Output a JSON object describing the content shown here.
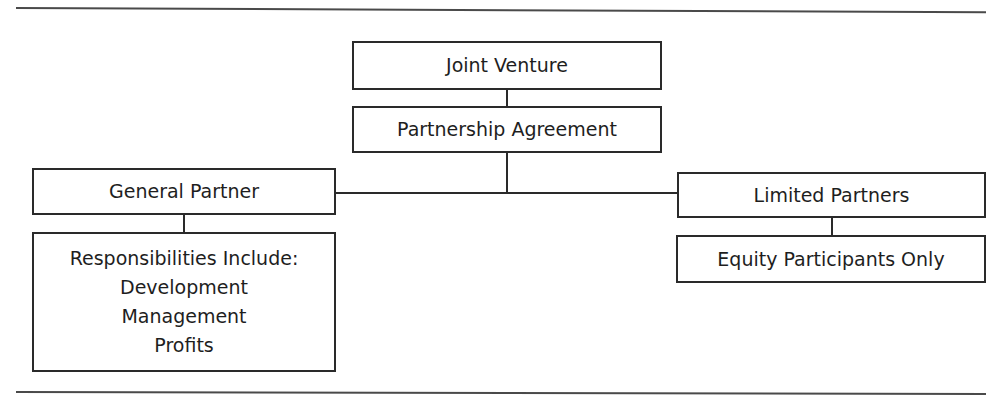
{
  "diagram": {
    "type": "organization-chart",
    "nodes": {
      "joint_venture": {
        "label": "Joint Venture"
      },
      "partnership_agreement": {
        "label": "Partnership Agreement"
      },
      "general_partner": {
        "label": "General Partner"
      },
      "responsibilities": {
        "heading": "Responsibilities Include:",
        "items": [
          "Development",
          "Management",
          "Profits"
        ]
      },
      "limited_partners": {
        "label": "Limited Partners"
      },
      "equity_participants": {
        "label": "Equity Participants Only"
      }
    },
    "edges": [
      [
        "joint_venture",
        "partnership_agreement"
      ],
      [
        "partnership_agreement",
        "general_partner"
      ],
      [
        "partnership_agreement",
        "limited_partners"
      ],
      [
        "general_partner",
        "responsibilities"
      ],
      [
        "limited_partners",
        "equity_participants"
      ]
    ]
  }
}
